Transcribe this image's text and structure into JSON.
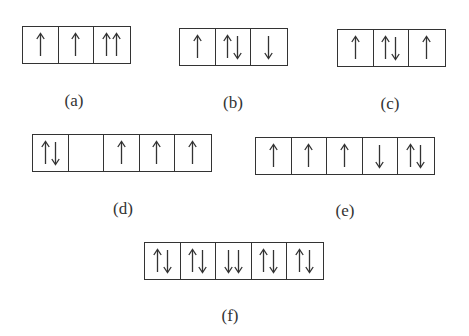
{
  "diagrams": [
    {
      "id": "a",
      "label": "(a)",
      "position": {
        "x": 22,
        "y": 26
      },
      "label_position": {
        "x": 54,
        "y": 91
      },
      "orbitals": [
        [
          "up"
        ],
        [
          "up"
        ],
        [
          "up",
          "up"
        ]
      ]
    },
    {
      "id": "b",
      "label": "(b)",
      "position": {
        "x": 179,
        "y": 28
      },
      "label_position": {
        "x": 213,
        "y": 93
      },
      "orbitals": [
        [
          "up"
        ],
        [
          "up",
          "down"
        ],
        [
          "down"
        ]
      ]
    },
    {
      "id": "c",
      "label": "(c)",
      "position": {
        "x": 337,
        "y": 29
      },
      "label_position": {
        "x": 370,
        "y": 94
      },
      "orbitals": [
        [
          "up"
        ],
        [
          "up",
          "down"
        ],
        [
          "up"
        ]
      ]
    },
    {
      "id": "d",
      "label": "(d)",
      "position": {
        "x": 32,
        "y": 134
      },
      "label_position": {
        "x": 103,
        "y": 199
      },
      "orbitals": [
        [
          "up",
          "down"
        ],
        [],
        [
          "up"
        ],
        [
          "up"
        ],
        [
          "up"
        ]
      ]
    },
    {
      "id": "e",
      "label": "(e)",
      "position": {
        "x": 255,
        "y": 137
      },
      "label_position": {
        "x": 325,
        "y": 201
      },
      "orbitals": [
        [
          "up"
        ],
        [
          "up"
        ],
        [
          "up"
        ],
        [
          "down"
        ],
        [
          "up",
          "down"
        ]
      ]
    },
    {
      "id": "f",
      "label": "(f)",
      "position": {
        "x": 144,
        "y": 242
      },
      "label_position": {
        "x": 210,
        "y": 306
      },
      "orbitals": [
        [
          "up",
          "down"
        ],
        [
          "up",
          "down"
        ],
        [
          "down",
          "down"
        ],
        [
          "up",
          "down"
        ],
        [
          "up",
          "down"
        ]
      ]
    }
  ],
  "colors": {
    "line": "#333333",
    "background": "#ffffff"
  }
}
